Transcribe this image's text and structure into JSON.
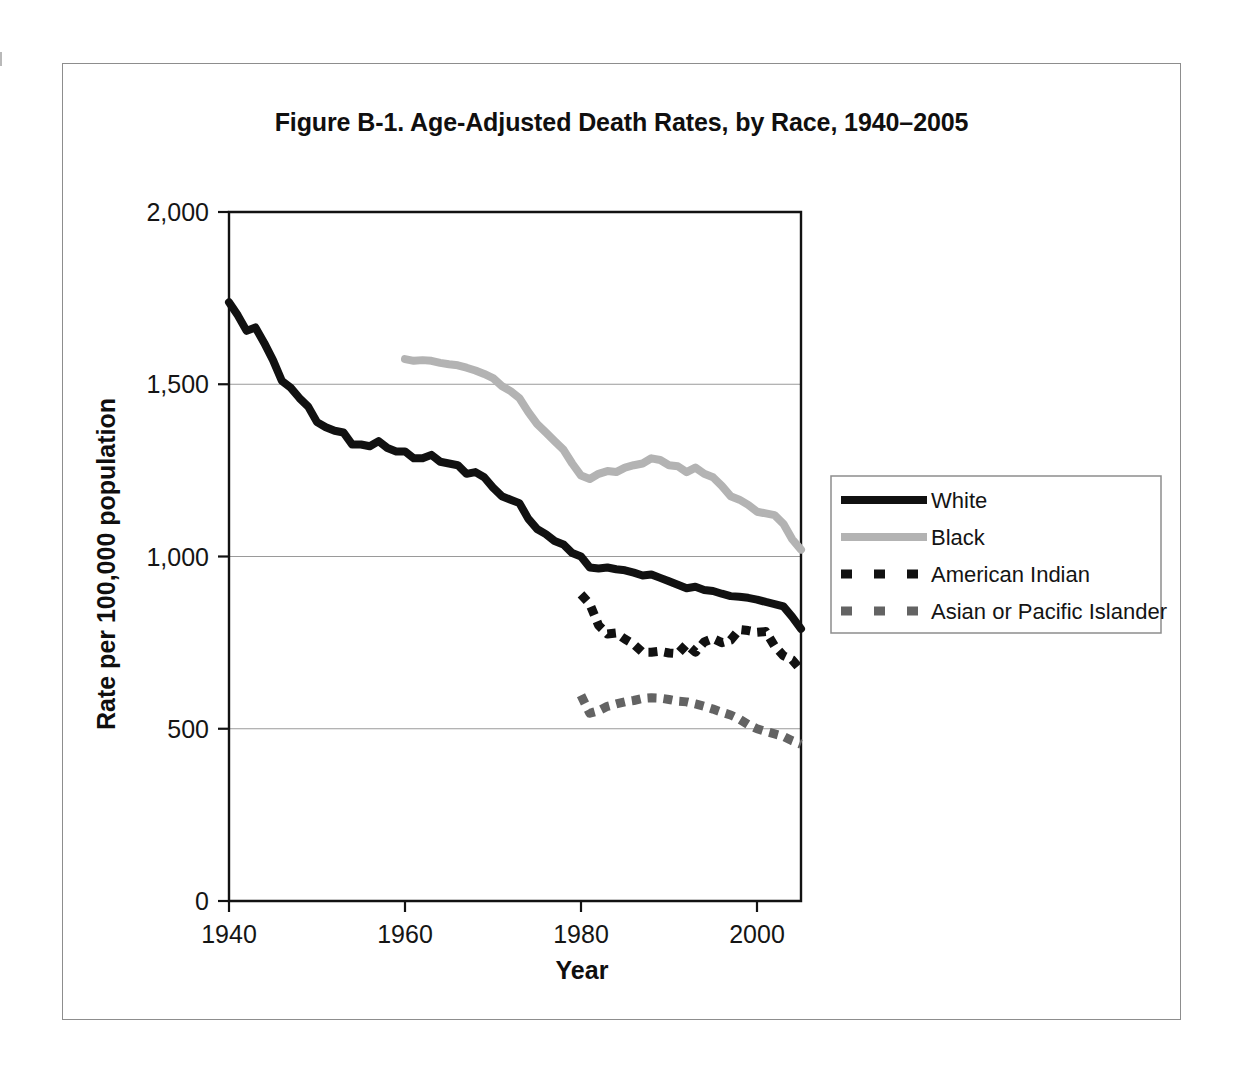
{
  "figure": {
    "title": "Figure B-1. Age-Adjusted Death Rates, by Race, 1940–2005"
  },
  "axes": {
    "x_title": "Year",
    "y_title": "Rate per 100,000 population",
    "x_ticks": [
      "1940",
      "1960",
      "1980",
      "2000"
    ],
    "y_ticks": [
      "0",
      "500",
      "1,000",
      "1,500",
      "2,000"
    ]
  },
  "legend": {
    "items": [
      {
        "label": "White",
        "color": "#111111",
        "style": "solid"
      },
      {
        "label": "Black",
        "color": "#b3b3b3",
        "style": "solid"
      },
      {
        "label": "American Indian",
        "color": "#111111",
        "style": "dashed"
      },
      {
        "label": "Asian or Pacific Islander",
        "color": "#636363",
        "style": "dashed"
      }
    ]
  },
  "chart_data": {
    "type": "line",
    "title": "Figure B-1. Age-Adjusted Death Rates, by Race, 1940–2005",
    "xlabel": "Year",
    "ylabel": "Rate per 100,000 population",
    "xlim": [
      1940,
      2005
    ],
    "ylim": [
      0,
      2000
    ],
    "x_ticks": [
      1940,
      1960,
      1980,
      2000
    ],
    "y_ticks": [
      0,
      500,
      1000,
      1500,
      2000
    ],
    "grid": "horizontal",
    "legend_position": "right",
    "series": [
      {
        "name": "White",
        "color": "#111111",
        "style": "solid",
        "x": [
          1940,
          1941,
          1942,
          1943,
          1944,
          1945,
          1946,
          1947,
          1948,
          1949,
          1950,
          1951,
          1952,
          1953,
          1954,
          1955,
          1956,
          1957,
          1958,
          1959,
          1960,
          1961,
          1962,
          1963,
          1964,
          1965,
          1966,
          1967,
          1968,
          1969,
          1970,
          1971,
          1972,
          1973,
          1974,
          1975,
          1976,
          1977,
          1978,
          1979,
          1980,
          1981,
          1982,
          1983,
          1984,
          1985,
          1986,
          1987,
          1988,
          1989,
          1990,
          1991,
          1992,
          1993,
          1994,
          1995,
          1996,
          1997,
          1998,
          1999,
          2000,
          2001,
          2002,
          2003,
          2004,
          2005
        ],
        "y": [
          1738,
          1700,
          1655,
          1665,
          1620,
          1570,
          1510,
          1490,
          1460,
          1435,
          1390,
          1375,
          1365,
          1360,
          1325,
          1325,
          1320,
          1335,
          1315,
          1305,
          1305,
          1285,
          1285,
          1295,
          1275,
          1270,
          1265,
          1240,
          1245,
          1230,
          1200,
          1175,
          1165,
          1155,
          1110,
          1080,
          1065,
          1045,
          1035,
          1010,
          1000,
          968,
          965,
          968,
          963,
          960,
          953,
          945,
          948,
          938,
          928,
          918,
          908,
          912,
          903,
          900,
          892,
          885,
          883,
          880,
          875,
          868,
          862,
          855,
          825,
          790
        ]
      },
      {
        "name": "Black",
        "color": "#b3b3b3",
        "style": "solid",
        "x": [
          1960,
          1961,
          1962,
          1963,
          1964,
          1965,
          1966,
          1967,
          1968,
          1969,
          1970,
          1971,
          1972,
          1973,
          1974,
          1975,
          1976,
          1977,
          1978,
          1979,
          1980,
          1981,
          1982,
          1983,
          1984,
          1985,
          1986,
          1987,
          1988,
          1989,
          1990,
          1991,
          1992,
          1993,
          1994,
          1995,
          1996,
          1997,
          1998,
          1999,
          2000,
          2001,
          2002,
          2003,
          2004,
          2005
        ],
        "y": [
          1573,
          1568,
          1570,
          1568,
          1562,
          1558,
          1555,
          1548,
          1540,
          1530,
          1518,
          1495,
          1480,
          1460,
          1420,
          1385,
          1360,
          1335,
          1310,
          1270,
          1235,
          1225,
          1240,
          1248,
          1245,
          1258,
          1265,
          1270,
          1285,
          1280,
          1265,
          1262,
          1245,
          1258,
          1240,
          1230,
          1205,
          1175,
          1165,
          1150,
          1130,
          1125,
          1120,
          1095,
          1050,
          1020
        ]
      },
      {
        "name": "American Indian",
        "color": "#111111",
        "style": "dashed",
        "x": [
          1980,
          1981,
          1982,
          1983,
          1984,
          1985,
          1986,
          1987,
          1988,
          1989,
          1990,
          1991,
          1992,
          1993,
          1994,
          1995,
          1996,
          1997,
          1998,
          1999,
          2000,
          2001,
          2002,
          2003,
          2004,
          2005
        ],
        "y": [
          890,
          862,
          800,
          775,
          778,
          760,
          745,
          722,
          722,
          725,
          720,
          718,
          745,
          722,
          752,
          762,
          750,
          757,
          788,
          785,
          780,
          782,
          740,
          712,
          700,
          670
        ]
      },
      {
        "name": "Asian or Pacific Islander",
        "color": "#636363",
        "style": "dashed",
        "x": [
          1980,
          1981,
          1982,
          1983,
          1984,
          1985,
          1986,
          1987,
          1988,
          1989,
          1990,
          1991,
          1992,
          1993,
          1994,
          1995,
          1996,
          1997,
          1998,
          1999,
          2000,
          2001,
          2002,
          2003,
          2004,
          2005
        ],
        "y": [
          597,
          545,
          552,
          565,
          572,
          578,
          582,
          588,
          590,
          589,
          585,
          580,
          578,
          572,
          565,
          557,
          548,
          540,
          528,
          512,
          500,
          492,
          485,
          478,
          465,
          455
        ]
      }
    ]
  }
}
